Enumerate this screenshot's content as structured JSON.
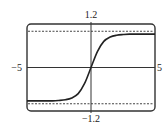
{
  "chart_data": {
    "type": "line",
    "title": "",
    "xlabel": "",
    "ylabel": "",
    "xlim": [
      -5,
      5
    ],
    "ylim": [
      -1.2,
      1.2
    ],
    "tick_labels": {
      "x_min": "−5",
      "x_max": "5",
      "y_max": "1.2",
      "y_min": "−1.2"
    },
    "grid": false,
    "legend": null,
    "series": [
      {
        "name": "curve",
        "description": "sigmoid (tanh-like) curve through origin, increasing, leveling off near y=±0.92",
        "x": [
          -5,
          -4,
          -3,
          -2.5,
          -2,
          -1.5,
          -1,
          -0.5,
          0,
          0.5,
          1,
          1.5,
          2,
          2.5,
          3,
          4,
          5
        ],
        "y": [
          -0.92,
          -0.92,
          -0.92,
          -0.91,
          -0.89,
          -0.84,
          -0.72,
          -0.44,
          0,
          0.44,
          0.72,
          0.84,
          0.89,
          0.91,
          0.92,
          0.92,
          0.92
        ]
      }
    ],
    "annotations": [
      {
        "type": "dashed-hline",
        "y": 1,
        "label": "upper horizontal asymptote"
      },
      {
        "type": "dashed-hline",
        "y": -1,
        "label": "lower horizontal asymptote"
      }
    ],
    "colors": {
      "frame": "#333333",
      "curve": "#222222",
      "axes": "#333333",
      "asymptote": "#444444"
    }
  }
}
